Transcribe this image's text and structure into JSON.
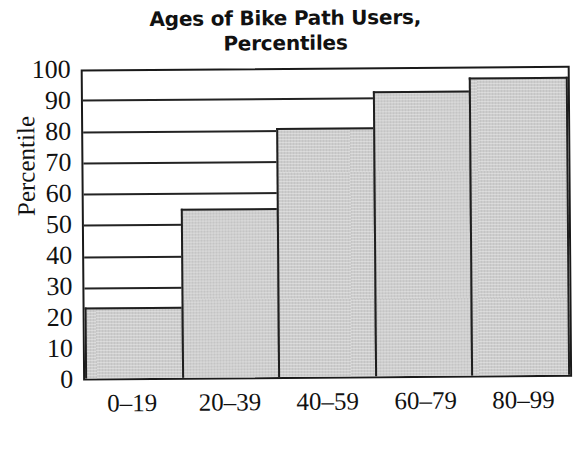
{
  "chart_data": {
    "type": "bar",
    "title": "Ages of Bike Path Users, Percentiles",
    "title_lines": [
      "Ages of Bike Path Users,",
      "Percentiles"
    ],
    "xlabel": "Age Range",
    "ylabel": "Percentile",
    "categories": [
      "0–19",
      "20–39",
      "40–59",
      "60–79",
      "80–99"
    ],
    "values": [
      23,
      55,
      81,
      93,
      97
    ],
    "ylim": [
      0,
      100
    ],
    "yticks": [
      0,
      10,
      20,
      30,
      40,
      50,
      60,
      70,
      80,
      90,
      100
    ],
    "ytick_labels": [
      "0",
      "10",
      "20",
      "30",
      "40",
      "50",
      "60",
      "70",
      "80",
      "90",
      "100"
    ],
    "grid": true,
    "grid_axis": "y",
    "legend": null,
    "bar_fill_color": "#cdcdcd",
    "bar_edge_color": "#1f1f1f",
    "axis_color": "#1a1a1a",
    "background_color": "#ffffff",
    "bars_contiguous": true
  }
}
